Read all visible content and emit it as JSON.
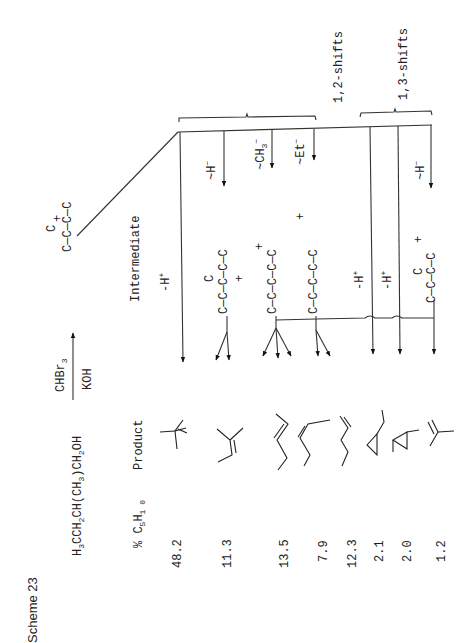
{
  "scheme": {
    "title": "Scheme 23",
    "reactant": "H3CCH2CH(CH3)CH2OH",
    "reagent_above": "CHBr3",
    "reagent_below": "KOH",
    "column_headers": {
      "yield": "% C5H10",
      "product": "Product",
      "intermediate": "Intermediate"
    },
    "cation": "C—C—C(C)—C+",
    "group_labels": [
      "1,2-shifts",
      "1,3-shifts"
    ],
    "shift_labels": {
      "deprotonation_1": "-H+",
      "hydride_12": "~H−",
      "methyl_12": "~CH3−",
      "ethyl_12": "~Et−",
      "deprotonation_2": "-H+",
      "deprotonation_3": "-H+",
      "hydride_13": "~H−"
    },
    "intermediates": [
      "C—C—C(C)+—C—C",
      "C—C—C+—C—C",
      "C—C—C—C+—C",
      "C—C(C)—C+—C"
    ],
    "products": [
      {
        "name": "2-methyl-1-butene",
        "percent": "48.2"
      },
      {
        "name": "2-methyl-2-butene",
        "percent": "11.3"
      },
      {
        "name": "trans-2-pentene",
        "percent": "13.5"
      },
      {
        "name": "cis-2-pentene",
        "percent": "7.9"
      },
      {
        "name": "1-pentene",
        "percent": "12.3"
      },
      {
        "name": "ethylcyclopropane",
        "percent": "2.1"
      },
      {
        "name": "1,2-dimethylcyclopropane",
        "percent": "2.0"
      },
      {
        "name": "3-methyl-1-butene",
        "percent": "1.2"
      }
    ]
  }
}
